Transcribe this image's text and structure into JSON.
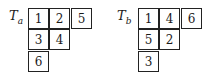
{
  "tableaux": [
    {
      "label": "T",
      "subscript": "a",
      "rows": [
        [
          "1",
          "2",
          "5"
        ],
        [
          "3",
          "4"
        ],
        [
          "6"
        ]
      ]
    },
    {
      "label": "T",
      "subscript": "b",
      "rows": [
        [
          "1",
          "4",
          "6"
        ],
        [
          "5",
          "2"
        ],
        [
          "3"
        ]
      ]
    }
  ]
}
